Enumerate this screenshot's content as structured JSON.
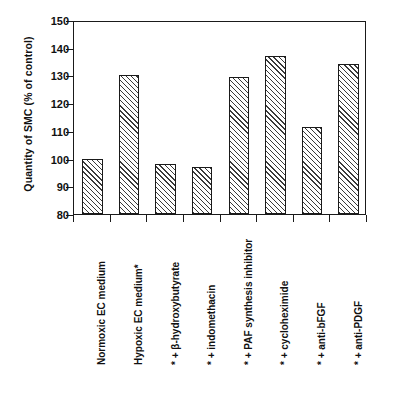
{
  "chart_data": {
    "type": "bar",
    "title": "",
    "xlabel": "",
    "ylabel": "Quantity of SMC (% of control)",
    "ylim": [
      80,
      150
    ],
    "yticks": [
      80,
      90,
      100,
      110,
      120,
      130,
      140,
      150
    ],
    "ytick_labels": [
      "80",
      "90",
      "100",
      "110",
      "120",
      "130",
      "140",
      "150"
    ],
    "grid": false,
    "legend": "none",
    "categories": [
      "Normoxic EC medium",
      "Hypoxic EC medium*",
      "* + β-hydroxybutyrate",
      "* + indomethacin",
      "* + PAF synthesis inhibitor",
      "* + cycloheximide",
      "* + anti-bFGF",
      "* + anti-PDGF"
    ],
    "values": [
      100,
      130,
      98,
      97,
      129.5,
      137,
      111.5,
      134
    ],
    "bar_style": {
      "fill": "#ffffff",
      "hatch": "diagonal",
      "edge": "#1a1a1a"
    }
  },
  "axis": {
    "frame_color": "#1a1a1a",
    "tick_color": "#1a1a1a",
    "text_color": "#111111"
  }
}
